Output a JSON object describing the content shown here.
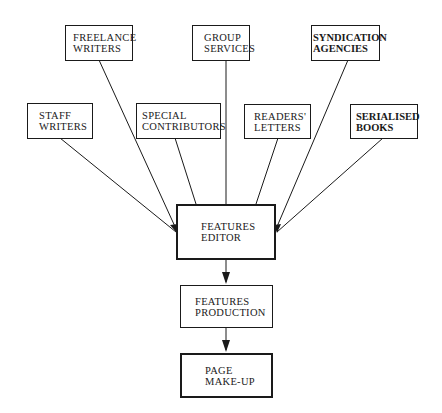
{
  "diagram": {
    "type": "flowchart",
    "nodes": {
      "freelance_writers": {
        "line1": "FREELANCE",
        "line2": "WRITERS"
      },
      "group_services": {
        "line1": "GROUP",
        "line2": "SERVICES"
      },
      "syndication_agencies": {
        "line1": "SYNDICATION",
        "line2": "AGENCIES"
      },
      "staff_writers": {
        "line1": "STAFF",
        "line2": "WRITERS"
      },
      "special_contributors": {
        "line1": "SPECIAL",
        "line2": "CONTRIBUTORS"
      },
      "readers_letters": {
        "line1": "READERS'",
        "line2": "LETTERS"
      },
      "serialised_books": {
        "line1": "SERIALISED",
        "line2": "BOOKS"
      },
      "features_editor": {
        "line1": "FEATURES",
        "line2": "EDITOR"
      },
      "features_production": {
        "line1": "FEATURES",
        "line2": "PRODUCTION"
      },
      "page_make_up": {
        "line1": "PAGE",
        "line2": "MAKE-UP"
      }
    },
    "edges": [
      {
        "from": "freelance_writers",
        "to": "features_editor"
      },
      {
        "from": "group_services",
        "to": "features_editor"
      },
      {
        "from": "syndication_agencies",
        "to": "features_editor"
      },
      {
        "from": "staff_writers",
        "to": "features_editor"
      },
      {
        "from": "special_contributors",
        "to": "features_editor"
      },
      {
        "from": "readers_letters",
        "to": "features_editor"
      },
      {
        "from": "serialised_books",
        "to": "features_editor"
      },
      {
        "from": "features_editor",
        "to": "features_production"
      },
      {
        "from": "features_production",
        "to": "page_make_up"
      }
    ]
  }
}
